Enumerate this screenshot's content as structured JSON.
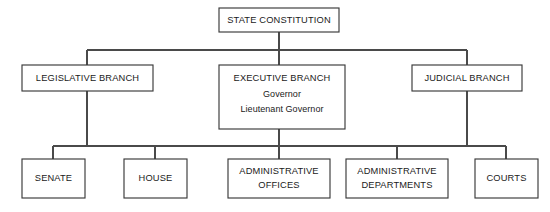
{
  "diagram": {
    "type": "org-chart",
    "background_color": "#ffffff",
    "line_color": "#4a4a4a",
    "box_stroke_color": "#3a3a3a",
    "text_color": "#1a1a1a",
    "nodes": {
      "root": {
        "id": "state-constitution",
        "label": "STATE CONSTITUTION",
        "x": 219,
        "y": 8,
        "w": 120,
        "h": 24
      },
      "legislative": {
        "id": "legislative-branch",
        "label": "LEGISLATIVE BRANCH",
        "x": 22,
        "y": 65,
        "w": 131,
        "h": 26
      },
      "executive": {
        "id": "executive-branch",
        "label": "EXECUTIVE BRANCH",
        "line2": "Governor",
        "line3": "Lieutenant Governor",
        "x": 219,
        "y": 65,
        "w": 126,
        "h": 64
      },
      "judicial": {
        "id": "judicial-branch",
        "label": "JUDICIAL BRANCH",
        "x": 412,
        "y": 65,
        "w": 110,
        "h": 26
      },
      "senate": {
        "id": "senate",
        "label": "SENATE",
        "x": 22,
        "y": 159,
        "w": 63,
        "h": 39
      },
      "house": {
        "id": "house",
        "label": "HOUSE",
        "x": 124,
        "y": 159,
        "w": 63,
        "h": 39
      },
      "administrative_offices": {
        "id": "administrative-offices",
        "label": "ADMINISTRATIVE",
        "line2": "OFFICES",
        "x": 228,
        "y": 159,
        "w": 102,
        "h": 39
      },
      "administrative_departments": {
        "id": "administrative-departments",
        "label": "ADMINISTRATIVE",
        "line2": "DEPARTMENTS",
        "x": 346,
        "y": 159,
        "w": 102,
        "h": 39
      },
      "courts": {
        "id": "courts",
        "label": "COURTS",
        "x": 475,
        "y": 159,
        "w": 63,
        "h": 39
      }
    },
    "connectors": {
      "top_bus_y": 50,
      "top_bus_x1": 87,
      "top_bus_x2": 467,
      "bottom_bus_y": 146,
      "bottom_bus_x1": 53,
      "bottom_bus_x2": 506
    },
    "relationships": [
      {
        "from": "state-constitution",
        "to": "legislative-branch"
      },
      {
        "from": "state-constitution",
        "to": "executive-branch"
      },
      {
        "from": "state-constitution",
        "to": "judicial-branch"
      },
      {
        "from": "legislative-branch",
        "to": "senate"
      },
      {
        "from": "legislative-branch",
        "to": "house"
      },
      {
        "from": "executive-branch",
        "to": "administrative-offices"
      },
      {
        "from": "executive-branch",
        "to": "administrative-departments"
      },
      {
        "from": "judicial-branch",
        "to": "courts"
      }
    ]
  }
}
